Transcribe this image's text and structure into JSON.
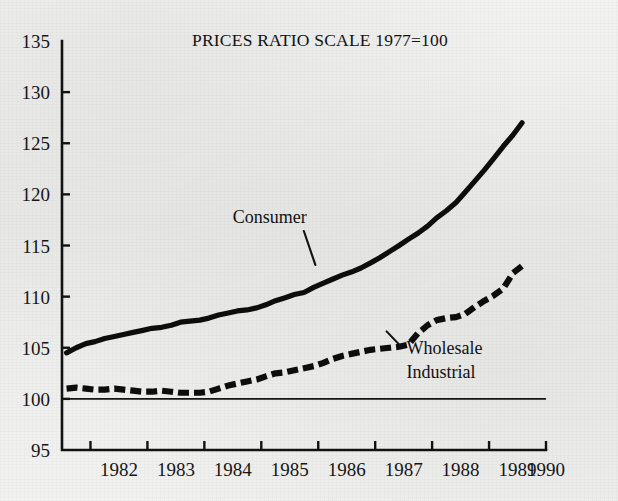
{
  "figure": {
    "name": "prices-ratio-scale-chart",
    "background_color": "#f1f1ef",
    "ink_color": "#111111"
  },
  "chart_data": {
    "type": "line",
    "title": "PRICES RATIO SCALE 1977=100",
    "xlabel": "",
    "ylabel": "",
    "xlim": [
      1981.5,
      1990.0
    ],
    "ylim": [
      95,
      135
    ],
    "grid": false,
    "legend_position": "inline-annotations",
    "y_ticks": [
      95,
      100,
      105,
      110,
      115,
      120,
      125,
      130,
      135
    ],
    "y_tick_labels": [
      "95",
      "100",
      "105",
      "110",
      "115",
      "120",
      "125",
      "130",
      "135"
    ],
    "x_ticks": [
      1982,
      1983,
      1984,
      1985,
      1986,
      1987,
      1988,
      1989,
      1990
    ],
    "x_tick_labels": [
      "1982",
      "1983",
      "1984",
      "1985",
      "1986",
      "1987",
      "1988",
      "1989",
      "1990"
    ],
    "reference_line": {
      "value": 100,
      "label": "1977=100 base"
    },
    "annotations": [
      {
        "text": "Consumer",
        "series": "Consumer",
        "x": 1985.15,
        "y": 117.2,
        "leader_to_x": 1985.95,
        "leader_to_y": 113.1
      },
      {
        "text_line1": "Wholesale",
        "text_line2": "Industrial",
        "series": "Wholesale Industrial",
        "x": 1987.55,
        "y": 104.4,
        "leader_to_x": 1987.2,
        "leader_to_y": 106.6
      }
    ],
    "series": [
      {
        "name": "Consumer",
        "style": "solid",
        "x": [
          1981.58,
          1981.75,
          1981.92,
          1982.08,
          1982.25,
          1982.42,
          1982.58,
          1982.75,
          1982.92,
          1983.08,
          1983.25,
          1983.42,
          1983.58,
          1983.75,
          1983.92,
          1984.08,
          1984.25,
          1984.42,
          1984.58,
          1984.75,
          1984.92,
          1985.08,
          1985.25,
          1985.42,
          1985.58,
          1985.75,
          1985.92,
          1986.08,
          1986.25,
          1986.42,
          1986.58,
          1986.75,
          1986.92,
          1987.08,
          1987.25,
          1987.42,
          1987.58,
          1987.75,
          1987.92,
          1988.08,
          1988.25,
          1988.42,
          1988.58,
          1988.75,
          1988.92,
          1989.08,
          1989.25,
          1989.42,
          1989.58
        ],
        "y": [
          104.5,
          105.0,
          105.4,
          105.6,
          105.9,
          106.1,
          106.3,
          106.5,
          106.7,
          106.9,
          107.0,
          107.2,
          107.5,
          107.6,
          107.7,
          107.9,
          108.2,
          108.4,
          108.6,
          108.7,
          108.9,
          109.2,
          109.6,
          109.9,
          110.2,
          110.4,
          110.9,
          111.3,
          111.7,
          112.1,
          112.4,
          112.8,
          113.3,
          113.8,
          114.4,
          115.0,
          115.6,
          116.2,
          116.9,
          117.7,
          118.4,
          119.2,
          120.2,
          121.3,
          122.4,
          123.5,
          124.7,
          125.8,
          127.0
        ]
      },
      {
        "name": "Wholesale Industrial",
        "style": "dashed",
        "x": [
          1981.58,
          1981.75,
          1981.92,
          1982.08,
          1982.25,
          1982.42,
          1982.58,
          1982.75,
          1982.92,
          1983.08,
          1983.25,
          1983.42,
          1983.58,
          1983.75,
          1983.92,
          1984.08,
          1984.25,
          1984.42,
          1984.58,
          1984.75,
          1984.92,
          1985.08,
          1985.25,
          1985.42,
          1985.58,
          1985.75,
          1985.92,
          1986.08,
          1986.25,
          1986.42,
          1986.58,
          1986.75,
          1986.92,
          1987.08,
          1987.25,
          1987.42,
          1987.58,
          1987.75,
          1987.92,
          1988.08,
          1988.25,
          1988.42,
          1988.58,
          1988.75,
          1988.92,
          1989.08,
          1989.25,
          1989.42,
          1989.58
        ],
        "y": [
          101.0,
          101.1,
          101.0,
          100.9,
          100.9,
          101.0,
          100.9,
          100.8,
          100.7,
          100.7,
          100.8,
          100.7,
          100.6,
          100.6,
          100.6,
          100.7,
          101.0,
          101.3,
          101.5,
          101.7,
          101.9,
          102.2,
          102.5,
          102.6,
          102.8,
          103.0,
          103.2,
          103.5,
          103.9,
          104.2,
          104.4,
          104.6,
          104.8,
          104.9,
          105.0,
          105.1,
          105.3,
          106.4,
          107.2,
          107.7,
          107.9,
          108.0,
          108.3,
          109.0,
          109.6,
          110.1,
          110.8,
          112.3,
          113.0
        ]
      }
    ]
  }
}
